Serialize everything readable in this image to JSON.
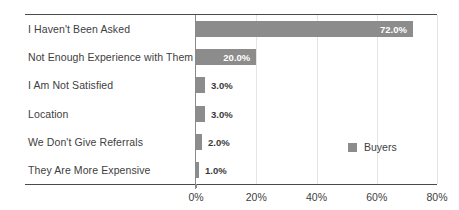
{
  "chart_data": {
    "type": "bar",
    "orientation": "horizontal",
    "title": "",
    "xlabel": "",
    "ylabel": "",
    "categories": [
      "I Haven't Been Asked",
      "Not Enough Experience with Them",
      "I Am Not Satisfied",
      "Location",
      "We Don't Give Referrals",
      "They Are More Expensive"
    ],
    "series": [
      {
        "name": "Buyers",
        "values": [
          72.0,
          20.0,
          3.0,
          3.0,
          2.0,
          1.0
        ],
        "color": "#8c8c8c"
      }
    ],
    "data_labels": [
      "72.0%",
      "20.0%",
      "3.0%",
      "3.0%",
      "2.0%",
      "1.0%"
    ],
    "label_placement": [
      "inside",
      "inside",
      "outside",
      "outside",
      "outside",
      "outside"
    ],
    "xlim": [
      0,
      80
    ],
    "xticks": [
      0,
      20,
      40,
      60,
      80
    ],
    "xtick_labels": [
      "0%",
      "20%",
      "40%",
      "60%",
      "80%"
    ],
    "grid": true,
    "grid_axis": "x",
    "grid_color": "#e4e4e4",
    "legend": {
      "position": "middle-right",
      "entries": [
        {
          "label": "Buyers",
          "color": "#8c8c8c"
        }
      ]
    },
    "axis_color": "#4a4a4a",
    "text_color": "#404040"
  }
}
